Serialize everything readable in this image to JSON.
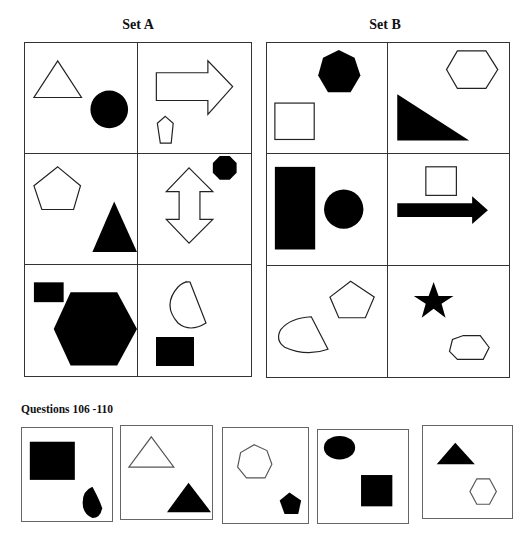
{
  "set_a": {
    "title": "Set A",
    "cells": [
      {
        "shapes": [
          {
            "type": "triangle",
            "fill": "outline"
          },
          {
            "type": "circle",
            "fill": "solid"
          }
        ]
      },
      {
        "shapes": [
          {
            "type": "right-arrow",
            "fill": "outline"
          },
          {
            "type": "pentagon",
            "fill": "outline"
          }
        ]
      },
      {
        "shapes": [
          {
            "type": "pentagon",
            "fill": "outline"
          },
          {
            "type": "triangle",
            "fill": "solid"
          }
        ]
      },
      {
        "shapes": [
          {
            "type": "up-down-arrow",
            "fill": "outline"
          },
          {
            "type": "octagon",
            "fill": "solid"
          }
        ]
      },
      {
        "shapes": [
          {
            "type": "rectangle",
            "fill": "solid"
          },
          {
            "type": "hexagon",
            "fill": "solid"
          }
        ]
      },
      {
        "shapes": [
          {
            "type": "semicircle",
            "fill": "outline"
          },
          {
            "type": "rectangle",
            "fill": "solid"
          }
        ]
      }
    ]
  },
  "set_b": {
    "title": "Set B",
    "cells": [
      {
        "shapes": [
          {
            "type": "heptagon",
            "fill": "solid"
          },
          {
            "type": "square",
            "fill": "outline"
          }
        ]
      },
      {
        "shapes": [
          {
            "type": "hexagon",
            "fill": "outline"
          },
          {
            "type": "right-triangle",
            "fill": "solid"
          }
        ]
      },
      {
        "shapes": [
          {
            "type": "rectangle",
            "fill": "solid"
          },
          {
            "type": "circle",
            "fill": "solid"
          }
        ]
      },
      {
        "shapes": [
          {
            "type": "square",
            "fill": "outline"
          },
          {
            "type": "right-arrow",
            "fill": "solid"
          }
        ]
      },
      {
        "shapes": [
          {
            "type": "pentagon",
            "fill": "outline"
          },
          {
            "type": "semicircle",
            "fill": "outline"
          }
        ]
      },
      {
        "shapes": [
          {
            "type": "star",
            "fill": "solid"
          },
          {
            "type": "heptagon",
            "fill": "outline"
          }
        ]
      }
    ]
  },
  "questions": {
    "label": "Questions 106 -110",
    "items": [
      {
        "number": 106,
        "shapes": [
          {
            "type": "square",
            "fill": "solid"
          },
          {
            "type": "semicircle",
            "fill": "solid"
          }
        ]
      },
      {
        "number": 107,
        "shapes": [
          {
            "type": "triangle",
            "fill": "outline"
          },
          {
            "type": "triangle",
            "fill": "solid"
          }
        ]
      },
      {
        "number": 108,
        "shapes": [
          {
            "type": "heptagon",
            "fill": "outline"
          },
          {
            "type": "pentagon",
            "fill": "solid"
          }
        ]
      },
      {
        "number": 109,
        "shapes": [
          {
            "type": "ellipse",
            "fill": "solid"
          },
          {
            "type": "square",
            "fill": "solid"
          }
        ]
      },
      {
        "number": 110,
        "shapes": [
          {
            "type": "triangle",
            "fill": "solid"
          },
          {
            "type": "hexagon",
            "fill": "outline"
          }
        ]
      }
    ]
  }
}
